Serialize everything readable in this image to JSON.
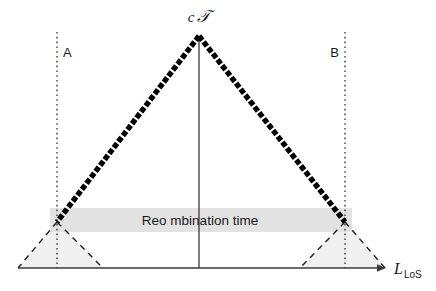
{
  "figure": {
    "kind": "spacetime-light-cone-diagram",
    "background_color": "#ffffff",
    "width": 436,
    "height": 291
  },
  "labels": {
    "apex": {
      "full": "cT",
      "c": "c",
      "script_t": "𝒯"
    },
    "marker_a": "A",
    "marker_b": "B",
    "band_text": "Reo  mbination time",
    "axis": {
      "symbol": "L",
      "subscript": "LoS",
      "full": "L_LoS"
    }
  },
  "colors": {
    "ink": "#1a1a1a",
    "cone_edge": "#000000",
    "band_fill": "#e2e2e2",
    "subcone_fill": "#f0f0f0",
    "axis_line": "#3a3a3a",
    "dotted_line": "#2b2b2b",
    "dashed_line": "#1f1f1f"
  },
  "geometry": {
    "apex": {
      "x": 199,
      "y": 36
    },
    "left_vertex": {
      "x": 57,
      "y": 222
    },
    "right_vertex": {
      "x": 345,
      "y": 222
    },
    "baseline_y": 268,
    "axis_start_x": 18,
    "axis_end_x": 385,
    "center_x": 199,
    "dotted_a_x": 57,
    "dotted_b_x": 345,
    "dotted_top_y": 32,
    "band": {
      "x": 50,
      "y": 208,
      "width": 302,
      "height": 24
    },
    "left_subcone": {
      "apex_x": 57,
      "apex_y": 222,
      "base_left_x": 18,
      "base_right_x": 103
    },
    "right_subcone": {
      "apex_x": 345,
      "apex_y": 222,
      "base_left_x": 300,
      "base_right_x": 385
    }
  }
}
